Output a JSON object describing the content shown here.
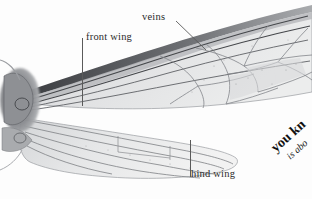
{
  "figure": {
    "kind": "insect-wing-illustration",
    "style": "grayscale halftone scientific illustration",
    "background_color": "#fdfdfd",
    "membrane_color": "#e3e4e6",
    "vein_color": "#6f7175",
    "dark_vein_color": "#3a3c40",
    "base_color": "#8a8c90",
    "caption_color": "#2b2b2b",
    "leader_color": "#5a5a5a"
  },
  "labels": {
    "veins": "veins",
    "front_wing": "front wing",
    "hind_wing": "hind wing"
  },
  "corner_text": {
    "line1": "you kn",
    "line2": "is abo",
    "rotation_degrees": -42,
    "note": "text clipped by page edge"
  },
  "parts": {
    "front_wing": "front wing",
    "hind_wing": "hind wing",
    "wing_base": "wing base articulation",
    "veins": "veins",
    "cells": "wing cells"
  }
}
